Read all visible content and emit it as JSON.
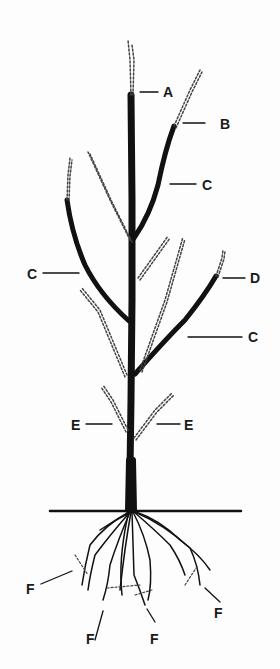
{
  "diagram": {
    "type": "fruit-tree-pruning-illustration",
    "colors": {
      "ink": "#111111",
      "background": "#fdfdfd"
    },
    "labels": [
      {
        "id": "A",
        "text": "A"
      },
      {
        "id": "B",
        "text": "B"
      },
      {
        "id": "C1",
        "text": "C"
      },
      {
        "id": "C2",
        "text": "C"
      },
      {
        "id": "D",
        "text": "D"
      },
      {
        "id": "C3",
        "text": "C"
      },
      {
        "id": "E1",
        "text": "E"
      },
      {
        "id": "E2",
        "text": "E"
      },
      {
        "id": "F1",
        "text": "F"
      },
      {
        "id": "F2",
        "text": "F"
      },
      {
        "id": "F3",
        "text": "F"
      },
      {
        "id": "F4",
        "text": "F"
      }
    ],
    "legend_notes": {
      "solid": "retained wood",
      "dotted": "pruned-off portions"
    }
  }
}
